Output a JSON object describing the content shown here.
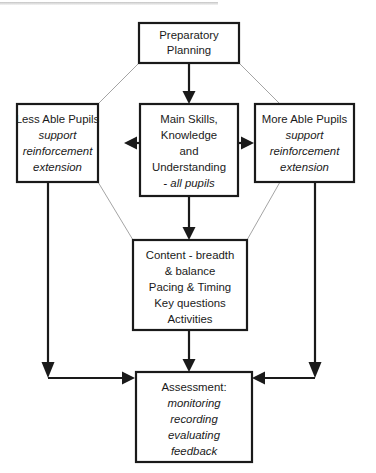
{
  "diagram": {
    "colors": {
      "background": "#ffffff",
      "box_border": "#1a1a1a",
      "box_fill": "#ffffff",
      "text": "#1a1a1a",
      "connector_strong": "#1a1a1a",
      "connector_faint": "#9a9a9a"
    },
    "nodes": {
      "preparatory_planning": {
        "name": "Preparatory Planning",
        "lines": [
          {
            "text": "Preparatory",
            "style": "regular"
          },
          {
            "text": "Planning",
            "style": "regular"
          }
        ]
      },
      "less_able_pupils": {
        "name": "Less Able Pupils",
        "lines": [
          {
            "text": "Less Able Pupils",
            "style": "regular"
          },
          {
            "text": "support",
            "style": "italic"
          },
          {
            "text": "reinforcement",
            "style": "italic"
          },
          {
            "text": "extension",
            "style": "italic"
          }
        ]
      },
      "main_skills": {
        "name": "Main Skills, Knowledge and Understanding",
        "lines": [
          {
            "text": "Main Skills,",
            "style": "regular"
          },
          {
            "text": "Knowledge",
            "style": "regular"
          },
          {
            "text": "and",
            "style": "regular"
          },
          {
            "text": "Understanding",
            "style": "regular"
          },
          {
            "text": "- all pupils",
            "style": "italic"
          }
        ]
      },
      "more_able_pupils": {
        "name": "More Able Pupils",
        "lines": [
          {
            "text": "More Able Pupils",
            "style": "regular"
          },
          {
            "text": "support",
            "style": "italic"
          },
          {
            "text": "reinforcement",
            "style": "italic"
          },
          {
            "text": "extension",
            "style": "italic"
          }
        ]
      },
      "content": {
        "name": "Content",
        "lines": [
          {
            "text": "Content - breadth",
            "style": "regular"
          },
          {
            "text": "& balance",
            "style": "regular"
          },
          {
            "text": "Pacing & Timing",
            "style": "regular"
          },
          {
            "text": "Key questions",
            "style": "regular"
          },
          {
            "text": "Activities",
            "style": "regular"
          }
        ]
      },
      "assessment": {
        "name": "Assessment",
        "lines": [
          {
            "text": "Assessment:",
            "style": "regular"
          },
          {
            "text": "monitoring",
            "style": "italic"
          },
          {
            "text": "recording",
            "style": "italic"
          },
          {
            "text": "evaluating",
            "style": "italic"
          },
          {
            "text": "feedback",
            "style": "italic"
          }
        ]
      }
    },
    "connectors": [
      {
        "id": "planning-to-main",
        "from": "preparatory_planning",
        "to": "main_skills",
        "style": "strong",
        "arrow": true
      },
      {
        "id": "planning-to-less-able",
        "from": "preparatory_planning",
        "to": "less_able_pupils",
        "style": "faint",
        "arrow": false
      },
      {
        "id": "planning-to-more-able",
        "from": "preparatory_planning",
        "to": "more_able_pupils",
        "style": "faint",
        "arrow": false
      },
      {
        "id": "main-to-less-able",
        "from": "main_skills",
        "to": "less_able_pupils",
        "style": "strong",
        "arrow": true
      },
      {
        "id": "main-to-more-able",
        "from": "main_skills",
        "to": "more_able_pupils",
        "style": "strong",
        "arrow": true
      },
      {
        "id": "main-to-content",
        "from": "main_skills",
        "to": "content",
        "style": "strong",
        "arrow": true
      },
      {
        "id": "less-able-to-content",
        "from": "less_able_pupils",
        "to": "content",
        "style": "faint",
        "arrow": false
      },
      {
        "id": "more-able-to-content",
        "from": "more_able_pupils",
        "to": "content",
        "style": "faint",
        "arrow": false
      },
      {
        "id": "less-able-to-assessment",
        "from": "less_able_pupils",
        "to": "assessment",
        "style": "strong",
        "arrow": true
      },
      {
        "id": "more-able-to-assessment",
        "from": "more_able_pupils",
        "to": "assessment",
        "style": "strong",
        "arrow": true
      },
      {
        "id": "content-to-assessment",
        "from": "content",
        "to": "assessment",
        "style": "strong",
        "arrow": true
      }
    ]
  }
}
